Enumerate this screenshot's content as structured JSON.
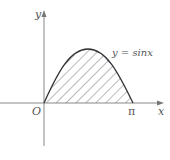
{
  "figure": {
    "type": "function-area-diagram",
    "axes": {
      "x_label": "x",
      "y_label": "y",
      "origin_label": "O",
      "x_tick_label": "π"
    },
    "curve": {
      "label": "y = sinx",
      "function": "sin(x)",
      "domain": [
        0,
        3.14159
      ]
    },
    "shaded_region": {
      "description": "Region between y = sinx and the x-axis from 0 to π",
      "pattern": "diagonal-hatch"
    },
    "colors": {
      "axis": "#888888",
      "curve": "#333333",
      "hatch": "#777777",
      "text": "#555555"
    }
  }
}
